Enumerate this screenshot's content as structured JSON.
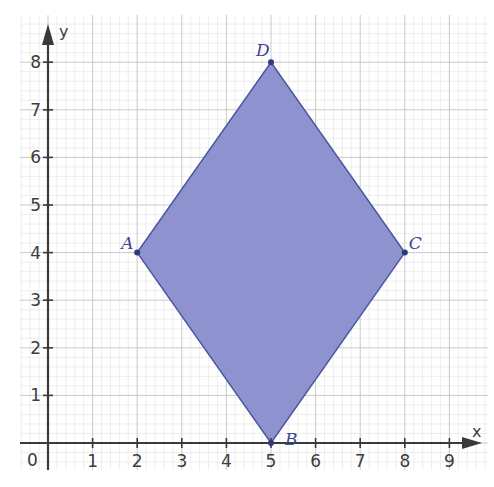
{
  "chart_data": {
    "type": "scatter",
    "title": "",
    "xlabel": "x",
    "ylabel": "y",
    "xlim": [
      0,
      9
    ],
    "ylim": [
      0,
      8
    ],
    "x_ticks": [
      1,
      2,
      3,
      4,
      5,
      6,
      7,
      8,
      9
    ],
    "y_ticks": [
      1,
      2,
      3,
      4,
      5,
      6,
      7,
      8
    ],
    "origin_label": "0",
    "grid": true,
    "minor_grid_per_unit": 5,
    "shape": {
      "kind": "polygon",
      "name": "rhombus ABCD",
      "fill": "#8e93cf",
      "stroke": "#4a56a0",
      "order": [
        "A",
        "B",
        "C",
        "D"
      ]
    },
    "points": [
      {
        "label": "A",
        "x": 2,
        "y": 4
      },
      {
        "label": "B",
        "x": 5,
        "y": 0
      },
      {
        "label": "C",
        "x": 8,
        "y": 4
      },
      {
        "label": "D",
        "x": 5,
        "y": 8
      }
    ]
  },
  "layout": {
    "origin_px": [
      48,
      443
    ],
    "unit_x_px": 44.6,
    "unit_y_px": 47.6,
    "grid_left_px": 20,
    "grid_right_px": 488,
    "grid_top_px": 15,
    "grid_bottom_px": 470
  },
  "colors": {
    "axis": "#3a3a3a",
    "major_grid": "#c9c9c9",
    "minor_grid": "#e6e6e6",
    "point": "#2f3a7a"
  }
}
